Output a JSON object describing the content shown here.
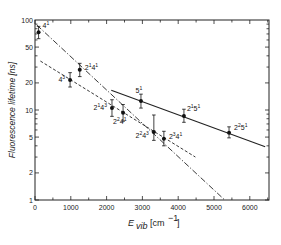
{
  "chart_data": {
    "type": "scatter",
    "title": "",
    "xlabel": "E_vib [cm^-1]",
    "ylabel": "Fluorescence lifetime [ns]",
    "xlim": [
      0,
      6500
    ],
    "ylim": [
      1,
      100
    ],
    "yscale": "log",
    "grid": false,
    "legend": null,
    "x_ticks": [
      0,
      1000,
      2000,
      3000,
      4000,
      5000,
      6000
    ],
    "x_tick_labels": [
      "0",
      "1000",
      "2000",
      "3000",
      "4000",
      "5000",
      "6000"
    ],
    "y_ticks": [
      1,
      2,
      5,
      10,
      20,
      50,
      100
    ],
    "y_tick_labels": [
      "1",
      "2",
      "5",
      "10",
      "20",
      "50",
      "100"
    ],
    "points": [
      {
        "label": "4¹",
        "base": "4",
        "sup": "1",
        "x": 100,
        "y": 73,
        "err_low": 62,
        "err_high": 85
      },
      {
        "label": "4³",
        "base": "4",
        "sup": "3",
        "x": 980,
        "y": 21.5,
        "err_low": 18,
        "err_high": 26
      },
      {
        "label": "2¹4¹",
        "base": "2",
        "sup": "1",
        "base2": "4",
        "sup2": "1",
        "x": 1250,
        "y": 28,
        "err_low": 23.5,
        "err_high": 33
      },
      {
        "label": "2¹4³",
        "base": "2",
        "sup": "1",
        "base2": "4",
        "sup2": "3",
        "x": 2150,
        "y": 10.5,
        "err_low": 8.5,
        "err_high": 13
      },
      {
        "label": "2²4¹",
        "base": "2",
        "sup": "2",
        "base2": "4",
        "sup2": "1",
        "x": 2460,
        "y": 9.3,
        "err_low": 7.5,
        "err_high": 11.5
      },
      {
        "label": "5¹",
        "base": "5",
        "sup": "1",
        "x": 2960,
        "y": 12.6,
        "err_low": 10.5,
        "err_high": 15
      },
      {
        "label": "2²4³",
        "base": "2",
        "sup": "2",
        "base2": "4",
        "sup2": "3",
        "x": 3320,
        "y": 5.7,
        "err_low": 4.6,
        "err_high": 8.8
      },
      {
        "label": "2³4¹",
        "base": "2",
        "sup": "3",
        "base2": "4",
        "sup2": "1",
        "x": 3600,
        "y": 4.8,
        "err_low": 4.0,
        "err_high": 5.8
      },
      {
        "label": "2¹5¹",
        "base": "2",
        "sup": "1",
        "base2": "5",
        "sup2": "1",
        "x": 4160,
        "y": 8.6,
        "err_low": 7.3,
        "err_high": 10.2
      },
      {
        "label": "2²5¹",
        "base": "2",
        "sup": "2",
        "base2": "5",
        "sup2": "1",
        "x": 5420,
        "y": 5.6,
        "err_low": 4.9,
        "err_high": 6.5
      }
    ],
    "fit_lines": [
      {
        "name": "dash-dot fit (4¹, 2¹4¹, 2²4¹ ...)",
        "style": "dashdot",
        "x": [
          50,
          5300
        ],
        "y": [
          88,
          1.0
        ]
      },
      {
        "name": "dashed fit (4³, 2¹4³, 2²4³ ...)",
        "style": "dashed",
        "x": [
          150,
          4480
        ],
        "y": [
          35,
          3.0
        ]
      },
      {
        "name": "solid fit (5¹, 2¹5¹, 2²5¹)",
        "style": "solid",
        "x": [
          2130,
          6430
        ],
        "y": [
          16.6,
          3.9
        ]
      }
    ]
  },
  "axes": {
    "ylabel": "Fluorescence lifetime [ns]",
    "xlabel_main": "E",
    "xlabel_sub": "vib",
    "xlabel_unit": "[cm",
    "xlabel_unit_sup": "−1",
    "xlabel_unit_close": "]"
  }
}
